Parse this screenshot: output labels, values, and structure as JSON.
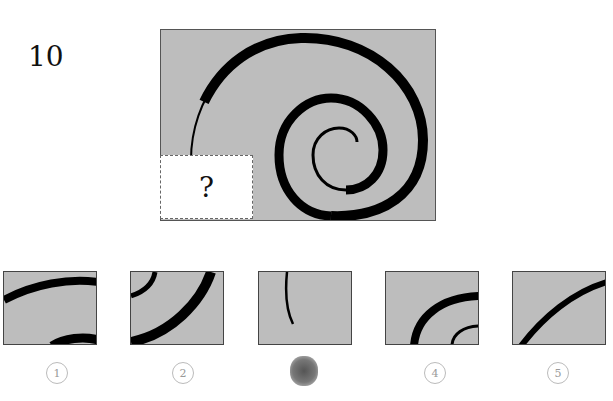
{
  "question": {
    "number": "10",
    "missing_marker": "?"
  },
  "options": [
    {
      "label": "1",
      "description": "two thick arcs: upper arc across top, partial arc at bottom right"
    },
    {
      "label": "2",
      "description": "thin arc top-left corner, thick arc sweeping from bottom-left to top-right"
    },
    {
      "label": "3",
      "description": "thin tapering curve from top going down",
      "marked": true
    },
    {
      "label": "4",
      "description": "thick arc bottom-left to right, thin small arc bottom-right"
    },
    {
      "label": "5",
      "description": "medium arc from bottom-left to top-right"
    }
  ],
  "colors": {
    "panel_fill": "#bdbdbd",
    "stroke": "#000000",
    "question_box": "#ffffff"
  }
}
